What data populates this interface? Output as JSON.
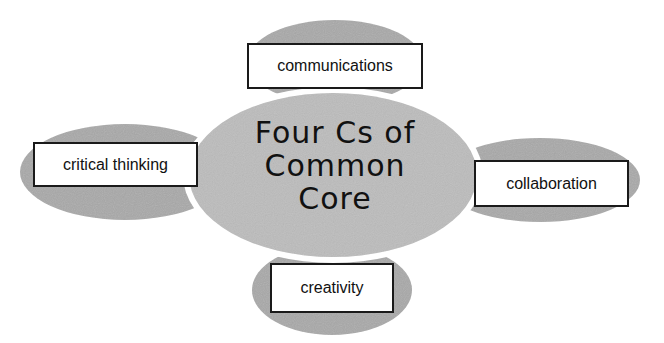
{
  "diagram": {
    "center": {
      "lines": [
        "Four Cs of",
        "Common",
        "Core"
      ],
      "fill": "#b9b9b9"
    },
    "satellites": [
      {
        "id": "top",
        "label": "communications",
        "fill": "#a9a9a9"
      },
      {
        "id": "left",
        "label": "critical thinking",
        "fill": "#a9a9a9"
      },
      {
        "id": "right",
        "label": "collaboration",
        "fill": "#a9a9a9"
      },
      {
        "id": "bottom",
        "label": "creativity",
        "fill": "#a9a9a9"
      }
    ]
  }
}
